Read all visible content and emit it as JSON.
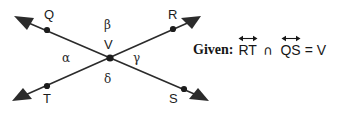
{
  "figure": {
    "stroke_color": "#2b2b2b",
    "text_color": "#1c1c1c",
    "background": "#ffffff"
  },
  "points": {
    "q": {
      "label": "Q",
      "x": 47,
      "y": 29,
      "label_x": 44,
      "label_y": 8
    },
    "r": {
      "label": "R",
      "x": 173,
      "y": 29,
      "label_x": 168,
      "label_y": 8
    },
    "t": {
      "label": "T",
      "x": 47,
      "y": 88,
      "label_x": 43,
      "label_y": 92
    },
    "s": {
      "label": "S",
      "x": 196,
      "y": 88,
      "label_x": 171,
      "label_y": 92
    },
    "v": {
      "label": "V",
      "x": 110,
      "y": 57,
      "label_x": 104,
      "label_y": 38
    }
  },
  "angles": {
    "alpha": {
      "label": "α",
      "x": 62,
      "y": 52
    },
    "beta": {
      "label": "β",
      "x": 104,
      "y": 19
    },
    "gamma": {
      "label": "γ",
      "x": 133,
      "y": 52
    },
    "delta": {
      "label": "δ",
      "x": 104,
      "y": 73
    }
  },
  "lines": [
    {
      "name": "line-QS",
      "from": "Q",
      "to": "S",
      "x1": 20,
      "y1": 19,
      "x2": 203,
      "y2": 98
    },
    {
      "name": "line-TR",
      "from": "T",
      "to": "R",
      "x1": 18,
      "y1": 98,
      "x2": 196,
      "y2": 19
    }
  ],
  "given": {
    "prefix": "Given:",
    "line_1": "RT",
    "operator": "∩",
    "line_2": "QS",
    "equals": "=",
    "result": "V"
  }
}
